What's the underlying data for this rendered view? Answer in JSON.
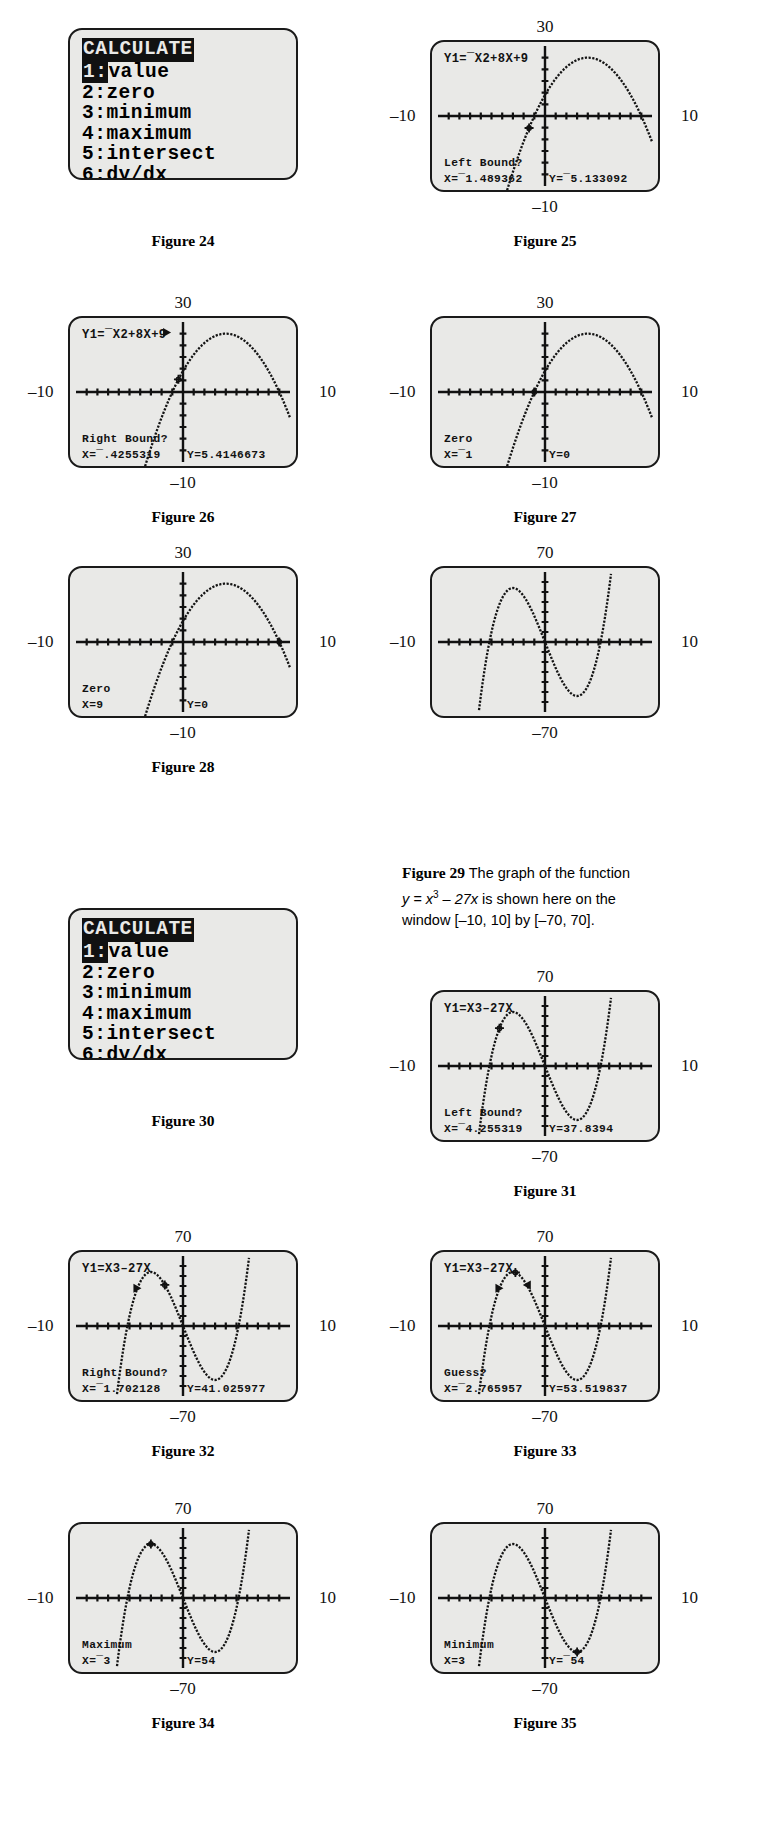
{
  "page": {
    "width": 765,
    "height": 1834
  },
  "figures": [
    {
      "id": "fig24",
      "caption": "Figure 24",
      "kind": "menu",
      "menu": {
        "title": "CALCULATE",
        "items": [
          {
            "num": "1",
            "label": "value",
            "selected": true
          },
          {
            "num": "2",
            "label": "zero",
            "selected": false
          },
          {
            "num": "3",
            "label": "minimum",
            "selected": false
          },
          {
            "num": "4",
            "label": "maximum",
            "selected": false
          },
          {
            "num": "5",
            "label": "intersect",
            "selected": false
          },
          {
            "num": "6",
            "label": "dy/dx",
            "selected": false
          },
          {
            "num": "7",
            "label": "∯f(x)dx",
            "selected": false
          }
        ]
      }
    },
    {
      "id": "fig25",
      "caption": "Figure 25",
      "kind": "graph",
      "axes": {
        "top": "30",
        "bottom": "–10",
        "left": "–10",
        "right": "10"
      },
      "eq": "Y1=¯X2+8X+9",
      "prompt": "Left Bound?",
      "xval": "X=¯1.489362",
      "yval": "Y=¯5.133092",
      "cursor_x": -1.489362,
      "cursor_y": -5.133092,
      "show_eq": true,
      "markers": []
    },
    {
      "id": "fig26",
      "caption": "Figure 26",
      "kind": "graph",
      "axes": {
        "top": "30",
        "bottom": "–10",
        "left": "–10",
        "right": "10"
      },
      "eq": "Y1=¯X2+8X+9",
      "prompt": "Right Bound?",
      "xval": "X=¯.4255319",
      "yval": "Y=5.4146673",
      "cursor_x": -0.4255319,
      "cursor_y": 5.4146673,
      "show_eq": true,
      "markers": [
        {
          "type": "right-arrow",
          "x": -1.489362,
          "y": 25.5
        }
      ]
    },
    {
      "id": "fig27",
      "caption": "Figure 27",
      "kind": "graph",
      "axes": {
        "top": "30",
        "bottom": "–10",
        "left": "–10",
        "right": "10"
      },
      "eq": "",
      "prompt": "Zero",
      "xval": "X=¯1",
      "yval": "Y=0",
      "cursor_x": -1,
      "cursor_y": 0,
      "show_eq": false,
      "markers": []
    },
    {
      "id": "fig28",
      "caption": "Figure 28",
      "kind": "graph",
      "axes": {
        "top": "30",
        "bottom": "–10",
        "left": "–10",
        "right": "10"
      },
      "eq": "",
      "prompt": "Zero",
      "xval": "X=9",
      "yval": "Y=0",
      "cursor_x": 9,
      "cursor_y": 0,
      "show_eq": false,
      "markers": []
    },
    {
      "id": "fig29",
      "caption_rich": {
        "bold": "Figure 29",
        "text1": " The graph of the function",
        "line2_pre": "y = x",
        "line2_sup": "3",
        "line2_post": " – 27x is shown here on the",
        "line3": "window [–10, 10] by [–70, 70]."
      },
      "kind": "graph-cubic",
      "axes": {
        "top": "70",
        "bottom": "–70",
        "left": "–10",
        "right": "10"
      },
      "eq": "",
      "prompt": "",
      "xval": "",
      "yval": "",
      "show_eq": false,
      "cursor_x": null,
      "markers": []
    },
    {
      "id": "fig30",
      "caption": "Figure 30",
      "kind": "menu",
      "menu": {
        "title": "CALCULATE",
        "items": [
          {
            "num": "1",
            "label": "value",
            "selected": true
          },
          {
            "num": "2",
            "label": "zero",
            "selected": false
          },
          {
            "num": "3",
            "label": "minimum",
            "selected": false
          },
          {
            "num": "4",
            "label": "maximum",
            "selected": false
          },
          {
            "num": "5",
            "label": "intersect",
            "selected": false
          },
          {
            "num": "6",
            "label": "dy/dx",
            "selected": false
          },
          {
            "num": "7",
            "label": "∯f(x)dx",
            "selected": false
          }
        ]
      }
    },
    {
      "id": "fig31",
      "caption": "Figure 31",
      "kind": "graph-cubic",
      "axes": {
        "top": "70",
        "bottom": "–70",
        "left": "–10",
        "right": "10"
      },
      "eq": "Y1=X3–27X",
      "prompt": "Left Bound?",
      "xval": "X=¯4.255319",
      "yval": "Y=37.8394",
      "cursor_x": -4.255319,
      "cursor_y": 37.8394,
      "show_eq": true,
      "markers": []
    },
    {
      "id": "fig32",
      "caption": "Figure 32",
      "kind": "graph-cubic",
      "axes": {
        "top": "70",
        "bottom": "–70",
        "left": "–10",
        "right": "10"
      },
      "eq": "Y1=X3–27X",
      "prompt": "Right Bound?",
      "xval": "X=¯1.702128",
      "yval": "Y=41.025977",
      "cursor_x": -1.702128,
      "cursor_y": 41.025977,
      "show_eq": true,
      "markers": [
        {
          "type": "right-arrow",
          "x": -4.255319,
          "y": 37.8394
        }
      ]
    },
    {
      "id": "fig33",
      "caption": "Figure 33",
      "kind": "graph-cubic",
      "axes": {
        "top": "70",
        "bottom": "–70",
        "left": "–10",
        "right": "10"
      },
      "eq": "Y1=X3–27X",
      "prompt": "Guess?",
      "xval": "X=¯2.765957",
      "yval": "Y=53.519837",
      "cursor_x": -2.765957,
      "cursor_y": 53.519837,
      "show_eq": true,
      "markers": [
        {
          "type": "right-arrow",
          "x": -4.255319,
          "y": 37.8394
        },
        {
          "type": "left-arrow",
          "x": -1.702128,
          "y": 41.025977
        }
      ]
    },
    {
      "id": "fig34",
      "caption": "Figure 34",
      "kind": "graph-cubic",
      "axes": {
        "top": "70",
        "bottom": "–70",
        "left": "–10",
        "right": "10"
      },
      "eq": "",
      "prompt": "Maximum",
      "xval": "X=¯3",
      "yval": "Y=54",
      "cursor_x": -3,
      "cursor_y": 54,
      "show_eq": false,
      "markers": []
    },
    {
      "id": "fig35",
      "caption": "Figure 35",
      "kind": "graph-cubic",
      "axes": {
        "top": "70",
        "bottom": "–70",
        "left": "–10",
        "right": "10"
      },
      "eq": "",
      "prompt": "Minimum",
      "xval": "X=3",
      "yval": "Y=¯54",
      "cursor_x": 3,
      "cursor_y": -54,
      "show_eq": false,
      "markers": []
    }
  ],
  "chart_data": [
    {
      "type": "line",
      "title": "Y1=¯X2+8X+9",
      "function": "y = -x^2 + 8x + 9",
      "xlim": [
        -10,
        10
      ],
      "ylim": [
        -30,
        30
      ],
      "xlabel": "",
      "ylabel": "",
      "grid": false,
      "appears_in": [
        "fig25",
        "fig26",
        "fig27",
        "fig28"
      ],
      "zeros": [
        -1,
        9
      ],
      "annotations": [
        {
          "figure": "fig25",
          "prompt": "Left Bound?",
          "x": -1.489362,
          "y": -5.133092
        },
        {
          "figure": "fig26",
          "prompt": "Right Bound?",
          "x": -0.4255319,
          "y": 5.4146673
        },
        {
          "figure": "fig27",
          "prompt": "Zero",
          "x": -1,
          "y": 0
        },
        {
          "figure": "fig28",
          "prompt": "Zero",
          "x": 9,
          "y": 0
        }
      ]
    },
    {
      "type": "line",
      "title": "Y1=X3–27X",
      "function": "y = x^3 - 27x",
      "xlim": [
        -10,
        10
      ],
      "ylim": [
        -70,
        70
      ],
      "xlabel": "",
      "ylabel": "",
      "grid": false,
      "appears_in": [
        "fig29",
        "fig31",
        "fig32",
        "fig33",
        "fig34",
        "fig35"
      ],
      "maximum": {
        "x": -3,
        "y": 54
      },
      "minimum": {
        "x": 3,
        "y": -54
      },
      "annotations": [
        {
          "figure": "fig31",
          "prompt": "Left Bound?",
          "x": -4.255319,
          "y": 37.8394
        },
        {
          "figure": "fig32",
          "prompt": "Right Bound?",
          "x": -1.702128,
          "y": 41.025977
        },
        {
          "figure": "fig33",
          "prompt": "Guess?",
          "x": -2.765957,
          "y": 53.519837
        },
        {
          "figure": "fig34",
          "prompt": "Maximum",
          "x": -3,
          "y": 54
        },
        {
          "figure": "fig35",
          "prompt": "Minimum",
          "x": 3,
          "y": -54
        }
      ]
    }
  ]
}
